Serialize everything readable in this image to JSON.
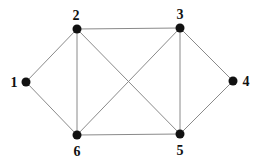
{
  "diagram": {
    "type": "undirected-graph",
    "colors": {
      "edge": "#8a8a8a",
      "node": "#111111",
      "label": "#111111",
      "background": "#ffffff"
    },
    "nodes": [
      {
        "id": "1",
        "label": "1",
        "x": 26,
        "y": 82,
        "label_x": 14,
        "label_y": 87,
        "anchor": "middle"
      },
      {
        "id": "2",
        "label": "2",
        "x": 77,
        "y": 29,
        "label_x": 76,
        "label_y": 20,
        "anchor": "middle"
      },
      {
        "id": "3",
        "label": "3",
        "x": 180,
        "y": 28,
        "label_x": 180,
        "label_y": 19,
        "anchor": "middle"
      },
      {
        "id": "4",
        "label": "4",
        "x": 233,
        "y": 81,
        "label_x": 246,
        "label_y": 86,
        "anchor": "middle"
      },
      {
        "id": "5",
        "label": "5",
        "x": 180,
        "y": 134,
        "label_x": 180,
        "label_y": 155,
        "anchor": "middle"
      },
      {
        "id": "6",
        "label": "6",
        "x": 77,
        "y": 135,
        "label_x": 77,
        "label_y": 156,
        "anchor": "middle"
      }
    ],
    "edges": [
      {
        "from": "1",
        "to": "2"
      },
      {
        "from": "1",
        "to": "6"
      },
      {
        "from": "2",
        "to": "3"
      },
      {
        "from": "2",
        "to": "6"
      },
      {
        "from": "2",
        "to": "5"
      },
      {
        "from": "3",
        "to": "6"
      },
      {
        "from": "3",
        "to": "5"
      },
      {
        "from": "3",
        "to": "4"
      },
      {
        "from": "4",
        "to": "5"
      },
      {
        "from": "6",
        "to": "5"
      }
    ]
  }
}
